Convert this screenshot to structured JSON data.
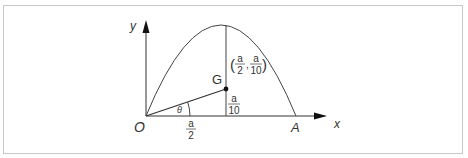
{
  "diagram": {
    "axes": {
      "x_label": "x",
      "y_label": "y",
      "origin_label": "O"
    },
    "points": {
      "A": "A",
      "G": "G"
    },
    "angle_label": "θ",
    "labels": {
      "horizontal_distance": {
        "num": "a",
        "den": "2"
      },
      "vertical_distance": {
        "num": "a",
        "den": "10"
      },
      "G_coordinates": {
        "open": "(",
        "x_num": "a",
        "x_den": "2",
        "sep": ",",
        "y_num": "a",
        "y_den": "10",
        "close": ")"
      }
    },
    "colors": {
      "stroke": "#333333",
      "border": "#c8c8c8"
    }
  }
}
